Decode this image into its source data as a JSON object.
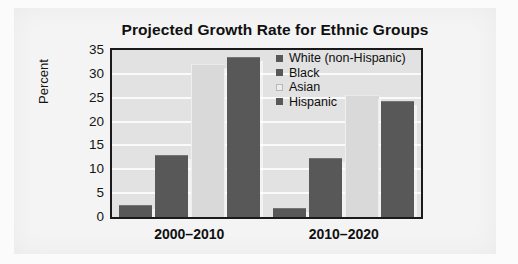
{
  "chart_data": {
    "type": "bar",
    "title": "Projected Growth Rate for Ethnic Groups",
    "xlabel": "",
    "ylabel": "Percent",
    "categories": [
      "2000–2010",
      "2010–2020"
    ],
    "ylim": [
      0,
      35
    ],
    "yticks": [
      "0",
      "5",
      "10",
      "15",
      "20",
      "25",
      "30",
      "35"
    ],
    "grid": true,
    "legend_position": "inside-top-right",
    "series": [
      {
        "name": "White (non-Hispanic)",
        "color": "#585858",
        "values": [
          2.5,
          1.8
        ]
      },
      {
        "name": "Black",
        "color": "#585858",
        "values": [
          13.0,
          12.3
        ]
      },
      {
        "name": "Asian",
        "color": "#d9d9d9",
        "values": [
          32.0,
          25.5
        ]
      },
      {
        "name": "Hispanic",
        "color": "#585858",
        "values": [
          33.5,
          24.3
        ]
      }
    ]
  },
  "legend": {
    "items": [
      {
        "label": "White (non-Hispanic)",
        "swatch": "dark"
      },
      {
        "label": "Black",
        "swatch": "dark"
      },
      {
        "label": "Asian",
        "swatch": "light"
      },
      {
        "label": "Hispanic",
        "swatch": "dark"
      }
    ]
  }
}
